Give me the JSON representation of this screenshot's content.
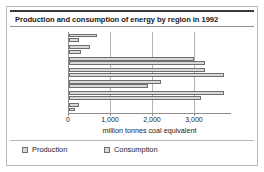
{
  "figure": {
    "title": "Production and consumption of energy by region in 1992"
  },
  "legend": {
    "entries": [
      {
        "label": "Production",
        "color": "#d9d9d9"
      },
      {
        "label": "Consumption",
        "color": "#d9d9d9"
      }
    ]
  },
  "axis": {
    "x_title": "million tonnes coal equivalent",
    "ticks": [
      "0",
      "1,000",
      "2,000",
      "3,000"
    ],
    "tick_values": [
      0,
      1000,
      2000,
      3000
    ]
  },
  "notes": {
    "former_ussr_sub": "(figures are for 1991)"
  },
  "chart_data": {
    "type": "bar",
    "orientation": "horizontal",
    "title": "Production and consumption of energy by region in 1992",
    "xlabel": "million tonnes coal equivalent",
    "ylabel": "",
    "xlim": [
      0,
      3810
    ],
    "xticks": [
      0,
      1000,
      2000,
      3000
    ],
    "xticklabels": [
      "0",
      "1,000",
      "2,000",
      "3,000"
    ],
    "grid": "vertical",
    "legend_position": "bottom-left",
    "categories": [
      "Africa",
      "South America",
      "North America",
      "Europe",
      "Former USSR",
      "Asia",
      "Oceania"
    ],
    "category_notes": {
      "Former USSR": "(figures are for 1991)"
    },
    "series": [
      {
        "name": "Production",
        "color": "#d9d9d9",
        "values": [
          670,
          500,
          2980,
          3230,
          2200,
          3680,
          230
        ]
      },
      {
        "name": "Consumption",
        "color": "#d9d9d9",
        "values": [
          250,
          280,
          3230,
          3690,
          1880,
          3150,
          150
        ]
      }
    ]
  }
}
